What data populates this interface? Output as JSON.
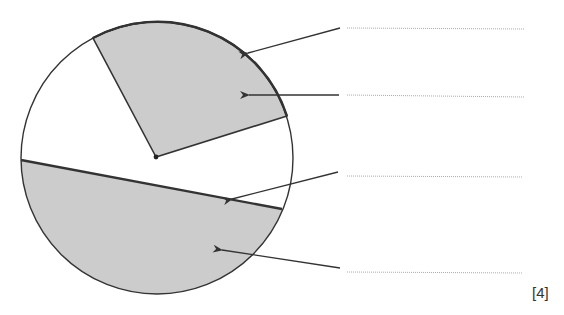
{
  "diagram": {
    "type": "circle-parts-labelling",
    "circle": {
      "cx": 157,
      "cy": 158,
      "r": 136
    },
    "centre_point": {
      "x": 156,
      "y": 157
    },
    "sector": {
      "radius_end_a": {
        "x": 93,
        "y": 38
      },
      "radius_end_b": {
        "x": 287,
        "y": 116
      },
      "shaded": true
    },
    "chord": {
      "start": {
        "x": 21,
        "y": 160
      },
      "end": {
        "x": 282,
        "y": 209
      }
    },
    "segment": {
      "shaded": true
    },
    "labels": [
      {
        "target": "arc",
        "arrow_from": {
          "x": 340,
          "y": 28
        },
        "arrow_tip": {
          "x": 246,
          "y": 53
        },
        "answer_line_y": 28,
        "text": ""
      },
      {
        "target": "sector",
        "arrow_from": {
          "x": 339,
          "y": 95
        },
        "arrow_tip": {
          "x": 247,
          "y": 95
        },
        "answer_line_y": 96,
        "text": ""
      },
      {
        "target": "chord",
        "arrow_from": {
          "x": 338,
          "y": 172
        },
        "arrow_tip": {
          "x": 230,
          "y": 199
        },
        "answer_line_y": 176,
        "text": ""
      },
      {
        "target": "segment",
        "arrow_from": {
          "x": 340,
          "y": 268
        },
        "arrow_tip": {
          "x": 220,
          "y": 250
        },
        "answer_line_y": 272,
        "text": ""
      }
    ],
    "colors": {
      "stroke": "#333333",
      "fill": "#cccccc",
      "answer_line": "#aaaaaa"
    }
  },
  "marks": "[4]"
}
